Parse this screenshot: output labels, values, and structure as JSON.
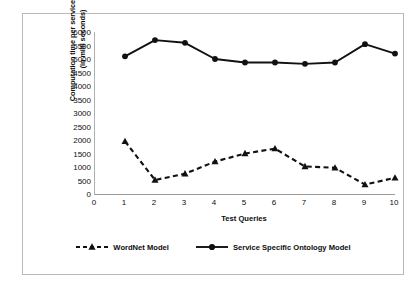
{
  "chart_data": {
    "type": "line",
    "title": "",
    "xlabel": "Test Queries",
    "ylabel": "Computation time per service  match (in milli seconds)",
    "ylabel_line1": "Computation time per service  match",
    "ylabel_line2": "(in milli seconds)",
    "categories": [
      "1",
      "2",
      "3",
      "4",
      "5",
      "6",
      "7",
      "8",
      "9",
      "10"
    ],
    "x": [
      1,
      2,
      3,
      4,
      5,
      6,
      7,
      8,
      9,
      10
    ],
    "xlim": [
      0,
      10
    ],
    "ylim": [
      0,
      6000
    ],
    "xticks": [
      "0",
      "1",
      "2",
      "3",
      "4",
      "5",
      "6",
      "7",
      "8",
      "9",
      "10"
    ],
    "yticks": [
      "0",
      "500",
      "1000",
      "1500",
      "2000",
      "2500",
      "3000",
      "3500",
      "4000",
      "4500",
      "5000",
      "5500",
      "6000"
    ],
    "grid": false,
    "legend_position": "bottom",
    "series": [
      {
        "name": "WordNet Model",
        "values": [
          1950,
          520,
          750,
          1200,
          1500,
          1680,
          1020,
          970,
          350,
          600
        ],
        "line_style": "dashed",
        "marker": "triangle",
        "color": "#111111"
      },
      {
        "name": "Service Specific  Ontology Model",
        "values": [
          5100,
          5700,
          5600,
          5000,
          4870,
          4870,
          4820,
          4870,
          5550,
          5200
        ],
        "line_style": "solid",
        "marker": "circle",
        "color": "#111111"
      }
    ]
  },
  "legend": {
    "items": [
      {
        "label": "WordNet Model"
      },
      {
        "label": "Service Specific  Ontology Model"
      }
    ]
  },
  "colors": {
    "series": "#111111",
    "axis": "#9a9a9a",
    "frame": "#b9b9b9",
    "text": "#0d0d0d",
    "background": "#ffffff"
  }
}
